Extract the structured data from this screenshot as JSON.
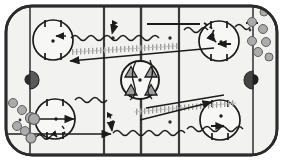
{
  "diagram": {
    "type": "ice-hockey-rink-drill",
    "orientation": "horizontal",
    "rink": {
      "surface_color": "#f2f2f0",
      "border_color": "#2b2b2b",
      "line_color": "#333333",
      "corner_radius": 26,
      "outside_color": "#ffffff"
    },
    "markings": {
      "goal_lines": [
        {
          "name": "left-goal-line",
          "x": 30
        },
        {
          "name": "right-goal-line",
          "x": 253
        }
      ],
      "blue_lines": [
        {
          "name": "left-blue-line",
          "x": 104
        },
        {
          "name": "right-blue-line",
          "x": 179
        }
      ],
      "center_line": {
        "name": "center-red-line",
        "x": 141
      },
      "faceoff_circles": [
        {
          "name": "faceoff-circle-top-left",
          "cx": 53,
          "cy": 40,
          "r": 20
        },
        {
          "name": "faceoff-circle-bottom-left",
          "cx": 55,
          "cy": 119,
          "r": 20
        },
        {
          "name": "faceoff-circle-top-right",
          "cx": 219,
          "cy": 41,
          "r": 20
        },
        {
          "name": "faceoff-circle-bottom-right",
          "cx": 220,
          "cy": 120,
          "r": 20
        },
        {
          "name": "center-faceoff-circle",
          "cx": 140,
          "cy": 80,
          "r": 19
        }
      ],
      "neutral_zone_dots": [
        {
          "name": "neutral-dot-upper-left",
          "cx": 113,
          "cy": 38
        },
        {
          "name": "neutral-dot-upper-right",
          "cx": 170,
          "cy": 38
        },
        {
          "name": "neutral-dot-lower-left",
          "cx": 113,
          "cy": 122
        },
        {
          "name": "neutral-dot-lower-right",
          "cx": 170,
          "cy": 122
        }
      ],
      "goals": [
        {
          "name": "goal-crease-left",
          "cx": 30,
          "cy": 80,
          "facing": "right",
          "color": "#555555"
        },
        {
          "name": "goal-crease-right",
          "cx": 253,
          "cy": 80,
          "facing": "left",
          "color": "#3a3a3a"
        }
      ]
    },
    "cones": {
      "label": "cones-in-center-circle",
      "count": 4,
      "color": "#8a8a8a",
      "positions": [
        {
          "cx": 131,
          "cy": 72
        },
        {
          "cx": 150,
          "cy": 72
        },
        {
          "cx": 131,
          "cy": 90
        },
        {
          "cx": 150,
          "cy": 90
        }
      ]
    },
    "players": {
      "label": "player-groups",
      "fill": "#a8a8a8",
      "stroke": "#555555",
      "groups": [
        {
          "name": "player-group-bottom-left-corner",
          "members": [
            {
              "cx": 13,
              "cy": 103,
              "r": 4.5
            },
            {
              "cx": 22,
              "cy": 110,
              "r": 4.5
            },
            {
              "cx": 31,
              "cy": 118,
              "r": 5.5
            },
            {
              "cx": 17,
              "cy": 126,
              "r": 4.5
            },
            {
              "cx": 25,
              "cy": 131,
              "r": 4.5
            },
            {
              "cx": 31,
              "cy": 138,
              "r": 5.0
            }
          ]
        },
        {
          "name": "player-group-top-right-corner",
          "members": [
            {
              "cx": 252,
              "cy": 22,
              "r": 4.5
            },
            {
              "cx": 262,
              "cy": 30,
              "r": 4.5
            },
            {
              "cx": 252,
              "cy": 41,
              "r": 4.5
            },
            {
              "cx": 266,
              "cy": 43,
              "r": 4.5
            },
            {
              "cx": 258,
              "cy": 51,
              "r": 4.5
            },
            {
              "cx": 268,
              "cy": 57,
              "r": 4.0
            }
          ]
        },
        {
          "name": "player-at-left-faceoff",
          "members": [
            {
              "cx": 34,
              "cy": 119,
              "r": 5.5
            }
          ]
        },
        {
          "name": "player-top-right-edge",
          "members": [
            {
              "cx": 264,
              "cy": 12,
              "r": 4.0
            }
          ]
        }
      ]
    },
    "paths": {
      "skate_arrows": {
        "label": "skating-with-arrow",
        "style": "solid-line-with-arrowhead",
        "color": "#1c1c1c"
      },
      "pass_arrows": {
        "label": "pass",
        "style": "dashed-line-with-arrowhead",
        "color": "#1c1c1c"
      },
      "puck_carry": {
        "label": "skating-with-puck",
        "style": "wavy-line",
        "color": "#1c1c1c"
      },
      "backward_skate": {
        "label": "backward-skating-hatched",
        "style": "hatched-ladder-line",
        "color": "#9a9a9a"
      }
    },
    "legend_counts": {
      "wavy_paths": 6,
      "solid_arrows": 8,
      "dashed_arrows": 4,
      "hatched_paths": 2
    }
  }
}
